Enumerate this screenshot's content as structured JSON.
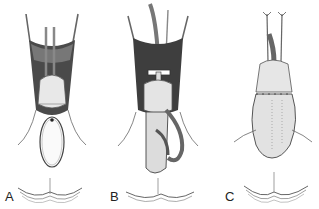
{
  "figure": {
    "panels": [
      {
        "id": "A",
        "label": "A",
        "description": "Retracted field with rods, glans-like structure and oval loop below"
      },
      {
        "id": "B",
        "label": "B",
        "description": "Retracted field with clamp bar, tube and elongated shaft with side loop"
      },
      {
        "id": "C",
        "label": "C",
        "description": "Closed, sutured structure with two suture needles at top"
      }
    ]
  }
}
